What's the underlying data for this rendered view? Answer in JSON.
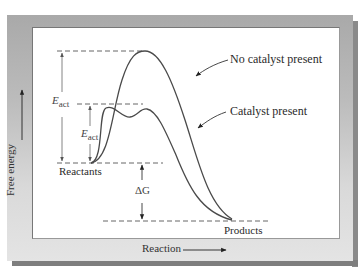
{
  "diagram": {
    "type": "reaction-energy-profile",
    "axes": {
      "y_label": "Free energy",
      "x_label": "Reaction"
    },
    "curves": [
      {
        "name": "No catalyst present",
        "label": "No catalyst present"
      },
      {
        "name": "Catalyst present",
        "label": "Catalyst present"
      }
    ],
    "levels": {
      "reactants": "Reactants",
      "products": "Products"
    },
    "annotations": {
      "eact_uncatalyzed": {
        "symbol": "E",
        "subscript": "act"
      },
      "eact_catalyzed": {
        "symbol": "E",
        "subscript": "act"
      },
      "delta_g": "ΔG"
    },
    "colors": {
      "frame": "#b5b5b5",
      "curve": "#4a4a4a",
      "dash": "#555555",
      "arrow": "#666666"
    }
  }
}
